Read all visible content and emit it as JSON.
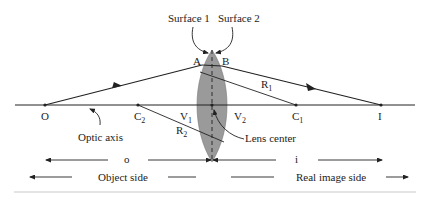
{
  "labels": {
    "surface1": "Surface 1",
    "surface2": "Surface 2",
    "A": "A",
    "B": "B",
    "R1": "R",
    "R1_sub": "1",
    "R2": "R",
    "R2_sub": "2",
    "O": "O",
    "C2": "C",
    "C2_sub": "2",
    "V1": "V",
    "V1_sub": "1",
    "V2": "V",
    "V2_sub": "2",
    "C1": "C",
    "C1_sub": "1",
    "I": "I",
    "optic_axis": "Optic axis",
    "lens_center": "Lens center",
    "o": "o",
    "i": "i",
    "object_side": "Object side",
    "real_image_side": "Real image side"
  },
  "colors": {
    "lens_fill": "#9a9a9a",
    "line": "#222222"
  }
}
